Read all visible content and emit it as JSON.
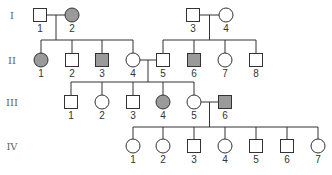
{
  "colors": {
    "affected": "#9a9a9a",
    "unaffected": "#ffffff",
    "line": "#333333"
  },
  "generations": [
    {
      "label": "I",
      "individuals": [
        {
          "id": "I-1",
          "number": "1",
          "sex": "male",
          "affected": false
        },
        {
          "id": "I-2",
          "number": "2",
          "sex": "female",
          "affected": true
        },
        {
          "id": "I-3",
          "number": "3",
          "sex": "male",
          "affected": false
        },
        {
          "id": "I-4",
          "number": "4",
          "sex": "female",
          "affected": false
        }
      ]
    },
    {
      "label": "II",
      "individuals": [
        {
          "id": "II-1",
          "number": "1",
          "sex": "female",
          "affected": true
        },
        {
          "id": "II-2",
          "number": "2",
          "sex": "male",
          "affected": false
        },
        {
          "id": "II-3",
          "number": "3",
          "sex": "male",
          "affected": true
        },
        {
          "id": "II-4",
          "number": "4",
          "sex": "female",
          "affected": false
        },
        {
          "id": "II-5",
          "number": "5",
          "sex": "male",
          "affected": false
        },
        {
          "id": "II-6",
          "number": "6",
          "sex": "male",
          "affected": true
        },
        {
          "id": "II-7",
          "number": "7",
          "sex": "female",
          "affected": false
        },
        {
          "id": "II-8",
          "number": "8",
          "sex": "male",
          "affected": false
        }
      ]
    },
    {
      "label": "III",
      "individuals": [
        {
          "id": "III-1",
          "number": "1",
          "sex": "male",
          "affected": false
        },
        {
          "id": "III-2",
          "number": "2",
          "sex": "female",
          "affected": false
        },
        {
          "id": "III-3",
          "number": "3",
          "sex": "male",
          "affected": false
        },
        {
          "id": "III-4",
          "number": "4",
          "sex": "female",
          "affected": true
        },
        {
          "id": "III-5",
          "number": "5",
          "sex": "female",
          "affected": false
        },
        {
          "id": "III-6",
          "number": "6",
          "sex": "male",
          "affected": true
        }
      ]
    },
    {
      "label": "IV",
      "individuals": [
        {
          "id": "IV-1",
          "number": "1",
          "sex": "female",
          "affected": false
        },
        {
          "id": "IV-2",
          "number": "2",
          "sex": "female",
          "affected": false
        },
        {
          "id": "IV-3",
          "number": "3",
          "sex": "male",
          "affected": false
        },
        {
          "id": "IV-4",
          "number": "4",
          "sex": "female",
          "affected": false
        },
        {
          "id": "IV-5",
          "number": "5",
          "sex": "male",
          "affected": false
        },
        {
          "id": "IV-6",
          "number": "6",
          "sex": "male",
          "affected": false
        },
        {
          "id": "IV-7",
          "number": "7",
          "sex": "female",
          "affected": false
        }
      ]
    }
  ],
  "matings": [
    {
      "partners": [
        "I-1",
        "I-2"
      ],
      "children": [
        "II-1",
        "II-2",
        "II-3",
        "II-4"
      ]
    },
    {
      "partners": [
        "I-3",
        "I-4"
      ],
      "children": [
        "II-5",
        "II-6",
        "II-7",
        "II-8"
      ]
    },
    {
      "partners": [
        "II-4",
        "II-5"
      ],
      "children": [
        "III-1",
        "III-2",
        "III-3",
        "III-4",
        "III-5"
      ]
    },
    {
      "partners": [
        "III-5",
        "III-6"
      ],
      "children": [
        "IV-1",
        "IV-2",
        "IV-3",
        "IV-4",
        "IV-5",
        "IV-6",
        "IV-7"
      ]
    }
  ]
}
